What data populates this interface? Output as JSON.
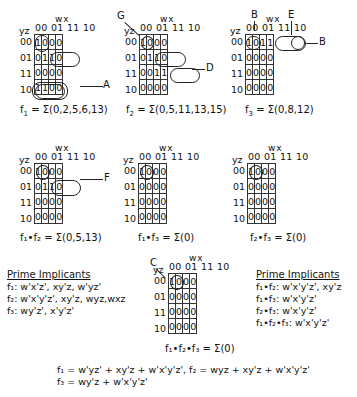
{
  "axis": {
    "col_var": "wx",
    "row_var": "yz",
    "col_headers": "00 01 11 10",
    "row_labels": [
      "00",
      "01",
      "11",
      "10"
    ]
  },
  "maps": [
    {
      "id": "f1",
      "cells": [
        [
          "1",
          "0",
          "0",
          "0"
        ],
        [
          "0",
          "1",
          "1",
          "0"
        ],
        [
          "0",
          "0",
          "0",
          "0"
        ],
        [
          "1",
          "1",
          "0",
          "0"
        ]
      ],
      "caption_prefix": "f",
      "caption_sub": "1",
      "caption_rest": " = Σ(0,2,5,6,13)",
      "annotations": [
        "A"
      ]
    },
    {
      "id": "f2",
      "cells": [
        [
          "1",
          "0",
          "0",
          "0"
        ],
        [
          "0",
          "1",
          "1",
          "0"
        ],
        [
          "0",
          "0",
          "1",
          "1"
        ],
        [
          "0",
          "0",
          "0",
          "0"
        ]
      ],
      "caption_prefix": "f",
      "caption_sub": "2",
      "caption_rest": " = Σ(0,5,11,13,15)",
      "annotations": [
        "G",
        "D"
      ]
    },
    {
      "id": "f3",
      "cells": [
        [
          "1",
          "0",
          "1",
          "1"
        ],
        [
          "0",
          "0",
          "0",
          "0"
        ],
        [
          "0",
          "0",
          "0",
          "0"
        ],
        [
          "0",
          "0",
          "0",
          "0"
        ]
      ],
      "caption_prefix": "f",
      "caption_sub": "3",
      "caption_rest": " = Σ(0,8,12)",
      "annotations": [
        "B",
        "E",
        "B"
      ]
    },
    {
      "id": "f1f2",
      "cells": [
        [
          "1",
          "0",
          "0",
          "0"
        ],
        [
          "0",
          "1",
          "1",
          "0"
        ],
        [
          "0",
          "0",
          "0",
          "0"
        ],
        [
          "0",
          "0",
          "0",
          "0"
        ]
      ],
      "caption": "f₁•f₂ = Σ(0,5,13)",
      "annotations": [
        "F"
      ]
    },
    {
      "id": "f1f3",
      "cells": [
        [
          "1",
          "0",
          "0",
          "0"
        ],
        [
          "0",
          "0",
          "0",
          "0"
        ],
        [
          "0",
          "0",
          "0",
          "0"
        ],
        [
          "0",
          "0",
          "0",
          "0"
        ]
      ],
      "caption": "f₁•f₃ = Σ(0)"
    },
    {
      "id": "f2f3",
      "cells": [
        [
          "1",
          "0",
          "0",
          "0"
        ],
        [
          "0",
          "0",
          "0",
          "0"
        ],
        [
          "0",
          "0",
          "0",
          "0"
        ],
        [
          "0",
          "0",
          "0",
          "0"
        ]
      ],
      "caption": "f₂•f₃ = Σ(0)"
    },
    {
      "id": "f1f2f3",
      "cells": [
        [
          "1",
          "0",
          "0",
          "0"
        ],
        [
          "0",
          "0",
          "0",
          "0"
        ],
        [
          "0",
          "0",
          "0",
          "0"
        ],
        [
          "0",
          "0",
          "0",
          "0"
        ]
      ],
      "caption": "f₁•f₂•f₃ = Σ(0)",
      "annotations": [
        "C"
      ]
    }
  ],
  "labels": {
    "A": "A",
    "B": "B",
    "C": "C",
    "D": "D",
    "E": "E",
    "F": "F",
    "G": "G"
  },
  "prime_left": {
    "title": "Prime Implicants",
    "lines": [
      "f₁: w'x'z', xy'z, w'yz'",
      "f₂: w'x'y'z', xy'z, wyz,wxz",
      "f₃: wy'z', x'y'z'"
    ]
  },
  "prime_right": {
    "title": "Prime Implicants",
    "lines": [
      "f₁•f₂: w'x'y'z', xy'z",
      "f₁•f₃: w'x'y'z'",
      "f₂•f₃: w'x'y'z'",
      "f₁•f₂•f₃: w'x'y'z'"
    ]
  },
  "equations": {
    "line1": "f₁ = w'yz' + xy'z + w'x'y'z',  f₂ = wyz + xy'z + w'x'y'z'",
    "line2": "f₃ = wy'z + w'x'y'z'"
  }
}
